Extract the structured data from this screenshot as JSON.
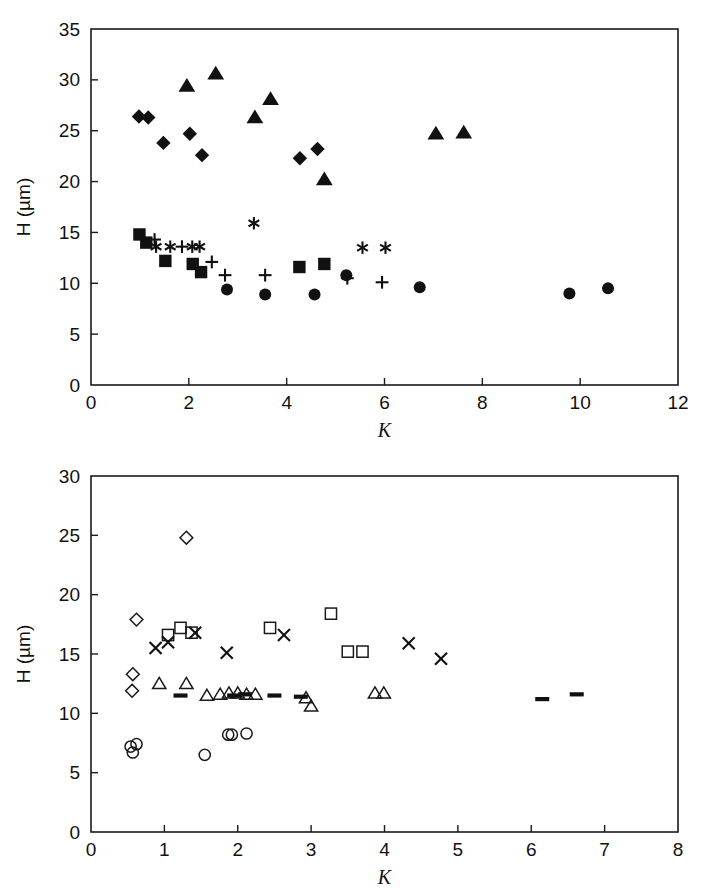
{
  "figure": {
    "title": "",
    "panel_count": 2
  },
  "chart_data": [
    {
      "type": "scatter",
      "panel": "top",
      "title": "",
      "xlabel": "K",
      "ylabel": "H (µm)",
      "ylabel_symbol": "H",
      "ylabel_units": "(µm)",
      "xlim": [
        0,
        12
      ],
      "ylim": [
        0,
        35
      ],
      "xticks": [
        0,
        2,
        4,
        6,
        8,
        10,
        12
      ],
      "yticks": [
        0,
        5,
        10,
        15,
        20,
        25,
        30,
        35
      ],
      "xticklabels": [
        "0",
        "2",
        "4",
        "6",
        "8",
        "10",
        "12"
      ],
      "yticklabels": [
        "0",
        "5",
        "10",
        "15",
        "20",
        "25",
        "30",
        "35"
      ],
      "grid": false,
      "legend": "none",
      "series": [
        {
          "name": "filled-diamond",
          "marker": "diamond-filled",
          "color": "#111111",
          "points": [
            [
              0.98,
              26.4
            ],
            [
              1.17,
              26.3
            ],
            [
              1.48,
              23.8
            ],
            [
              2.02,
              24.7
            ],
            [
              2.27,
              22.6
            ],
            [
              4.27,
              22.3
            ],
            [
              4.63,
              23.2
            ]
          ]
        },
        {
          "name": "filled-triangle",
          "marker": "triangle-filled",
          "color": "#111111",
          "points": [
            [
              1.96,
              29.4
            ],
            [
              2.55,
              30.6
            ],
            [
              3.35,
              26.3
            ],
            [
              3.67,
              28.1
            ],
            [
              4.77,
              20.2
            ],
            [
              7.05,
              24.7
            ],
            [
              7.62,
              24.8
            ]
          ]
        },
        {
          "name": "filled-square",
          "marker": "square-filled",
          "color": "#111111",
          "points": [
            [
              0.99,
              14.8
            ],
            [
              1.13,
              14.0
            ],
            [
              1.52,
              12.2
            ],
            [
              2.08,
              11.9
            ],
            [
              2.25,
              11.1
            ],
            [
              4.26,
              11.6
            ],
            [
              4.77,
              11.9
            ]
          ]
        },
        {
          "name": "asterisk",
          "marker": "asterisk",
          "color": "#111111",
          "points": [
            [
              1.33,
              13.6
            ],
            [
              1.62,
              13.6
            ],
            [
              2.07,
              13.6
            ],
            [
              2.22,
              13.6
            ],
            [
              3.33,
              15.9
            ],
            [
              5.55,
              13.5
            ],
            [
              6.02,
              13.5
            ]
          ]
        },
        {
          "name": "plus",
          "marker": "plus",
          "color": "#111111",
          "points": [
            [
              1.3,
              14.3
            ],
            [
              1.86,
              13.6
            ],
            [
              2.47,
              12.1
            ],
            [
              2.74,
              10.8
            ],
            [
              3.56,
              10.8
            ],
            [
              5.24,
              10.5
            ],
            [
              5.95,
              10.1
            ]
          ]
        },
        {
          "name": "filled-circle",
          "marker": "circle-filled",
          "color": "#111111",
          "points": [
            [
              2.78,
              9.4
            ],
            [
              3.56,
              8.9
            ],
            [
              4.57,
              8.9
            ],
            [
              5.22,
              10.8
            ],
            [
              6.72,
              9.6
            ],
            [
              9.78,
              9.0
            ],
            [
              10.57,
              9.5
            ]
          ]
        }
      ]
    },
    {
      "type": "scatter",
      "panel": "bottom",
      "title": "",
      "xlabel": "K",
      "ylabel": "H (µm)",
      "ylabel_symbol": "H",
      "ylabel_units": "(µm)",
      "xlim": [
        0,
        8
      ],
      "ylim": [
        0,
        30
      ],
      "xticks": [
        0,
        1,
        2,
        3,
        4,
        5,
        6,
        7,
        8
      ],
      "yticks": [
        0,
        5,
        10,
        15,
        20,
        25,
        30
      ],
      "xticklabels": [
        "0",
        "1",
        "2",
        "3",
        "4",
        "5",
        "6",
        "7",
        "8"
      ],
      "yticklabels": [
        "0",
        "5",
        "10",
        "15",
        "20",
        "25",
        "30"
      ],
      "grid": false,
      "legend": "none",
      "series": [
        {
          "name": "open-diamond",
          "marker": "diamond-open",
          "color": "#1a1a1a",
          "points": [
            [
              0.62,
              17.9
            ],
            [
              1.3,
              24.8
            ],
            [
              0.57,
              13.3
            ],
            [
              0.56,
              11.9
            ]
          ]
        },
        {
          "name": "open-square",
          "marker": "square-open",
          "color": "#1a1a1a",
          "points": [
            [
              1.05,
              16.6
            ],
            [
              1.22,
              17.2
            ],
            [
              1.37,
              16.8
            ],
            [
              2.44,
              17.2
            ],
            [
              3.27,
              18.4
            ],
            [
              3.5,
              15.2
            ],
            [
              3.7,
              15.2
            ]
          ]
        },
        {
          "name": "cross",
          "marker": "cross",
          "color": "#1a1a1a",
          "points": [
            [
              0.88,
              15.5
            ],
            [
              1.05,
              16.0
            ],
            [
              1.42,
              16.8
            ],
            [
              1.85,
              15.1
            ],
            [
              2.63,
              16.6
            ],
            [
              4.33,
              15.9
            ],
            [
              4.77,
              14.6
            ]
          ]
        },
        {
          "name": "open-triangle",
          "marker": "triangle-open",
          "color": "#1a1a1a",
          "points": [
            [
              0.93,
              12.5
            ],
            [
              1.3,
              12.5
            ],
            [
              1.58,
              11.5
            ],
            [
              1.76,
              11.6
            ],
            [
              1.88,
              11.7
            ],
            [
              2.0,
              11.7
            ],
            [
              2.12,
              11.6
            ],
            [
              2.24,
              11.6
            ],
            [
              2.93,
              11.3
            ],
            [
              3.0,
              10.6
            ],
            [
              3.87,
              11.7
            ],
            [
              3.99,
              11.7
            ]
          ]
        },
        {
          "name": "open-circle",
          "marker": "circle-open",
          "color": "#1a1a1a",
          "points": [
            [
              0.54,
              7.2
            ],
            [
              0.62,
              7.4
            ],
            [
              0.57,
              6.7
            ],
            [
              1.55,
              6.5
            ],
            [
              1.87,
              8.2
            ],
            [
              1.92,
              8.2
            ],
            [
              2.12,
              8.3
            ]
          ]
        },
        {
          "name": "dash",
          "marker": "dash",
          "color": "#111111",
          "points": [
            [
              1.22,
              11.5
            ],
            [
              1.95,
              11.5
            ],
            [
              2.1,
              11.6
            ],
            [
              2.5,
              11.5
            ],
            [
              2.86,
              11.4
            ],
            [
              6.15,
              11.2
            ],
            [
              6.62,
              11.6
            ]
          ]
        }
      ]
    }
  ]
}
